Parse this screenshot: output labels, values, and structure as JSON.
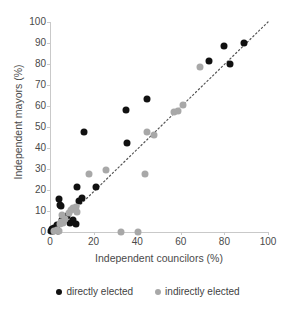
{
  "chart_data": {
    "type": "scatter",
    "title": "",
    "xlabel": "Independent councilors (%)",
    "ylabel": "Independent mayors (%)",
    "xlim": [
      0,
      100
    ],
    "ylim": [
      0,
      100
    ],
    "xticks": [
      0,
      20,
      40,
      60,
      80,
      100
    ],
    "yticks": [
      0,
      10,
      20,
      30,
      40,
      50,
      60,
      70,
      80,
      90,
      100
    ],
    "grid": false,
    "legend_position": "bottom",
    "colors": {
      "directly_elected": "#111111",
      "indirectly_elected": "#a8a8a8",
      "axis": "#c9c9c9",
      "text": "#4a4a4a"
    },
    "trendline": {
      "style": "dotted",
      "color": "#555555",
      "x": [
        1,
        100
      ],
      "y": [
        0,
        100
      ]
    },
    "series": [
      {
        "name": "directly elected",
        "marker": "circle",
        "color": "#111111",
        "points": [
          [
            0.5,
            0.5
          ],
          [
            1.0,
            1.5
          ],
          [
            1.5,
            0.5
          ],
          [
            2.0,
            2.0
          ],
          [
            2.5,
            1.0
          ],
          [
            3.0,
            3.5
          ],
          [
            3.5,
            0.5
          ],
          [
            4.0,
            15.5
          ],
          [
            4.5,
            13.0
          ],
          [
            5.0,
            12.5
          ],
          [
            5.5,
            5.5
          ],
          [
            6.5,
            6.5
          ],
          [
            8.0,
            7.5
          ],
          [
            9.0,
            4.5
          ],
          [
            10.5,
            5.5
          ],
          [
            12.0,
            4.0
          ],
          [
            12.5,
            21.5
          ],
          [
            13.5,
            15.0
          ],
          [
            14.5,
            16.0
          ],
          [
            15.5,
            47.5
          ],
          [
            21.0,
            21.5
          ],
          [
            35.0,
            58.0
          ],
          [
            35.5,
            42.5
          ],
          [
            44.5,
            63.5
          ],
          [
            73.0,
            81.5
          ],
          [
            80.0,
            88.5
          ],
          [
            82.5,
            80.0
          ],
          [
            89.0,
            90.0
          ]
        ]
      },
      {
        "name": "indirectly elected",
        "marker": "circle",
        "color": "#a8a8a8",
        "points": [
          [
            2.0,
            0.5
          ],
          [
            3.0,
            1.0
          ],
          [
            4.0,
            0.5
          ],
          [
            4.5,
            4.0
          ],
          [
            5.0,
            5.0
          ],
          [
            5.5,
            8.0
          ],
          [
            6.0,
            4.5
          ],
          [
            7.0,
            6.0
          ],
          [
            8.5,
            9.0
          ],
          [
            9.5,
            10.5
          ],
          [
            10.5,
            11.5
          ],
          [
            12.0,
            12.0
          ],
          [
            12.5,
            9.5
          ],
          [
            18.0,
            27.5
          ],
          [
            25.5,
            29.5
          ],
          [
            32.5,
            0.0
          ],
          [
            40.5,
            0.0
          ],
          [
            43.5,
            27.5
          ],
          [
            44.5,
            47.5
          ],
          [
            47.5,
            46.0
          ],
          [
            57.0,
            57.0
          ],
          [
            58.5,
            57.5
          ],
          [
            61.0,
            60.5
          ],
          [
            69.0,
            78.5
          ]
        ]
      }
    ]
  },
  "legend": {
    "items": [
      {
        "label": "directly elected",
        "color": "#111111"
      },
      {
        "label": "indirectly elected",
        "color": "#a8a8a8"
      }
    ]
  }
}
